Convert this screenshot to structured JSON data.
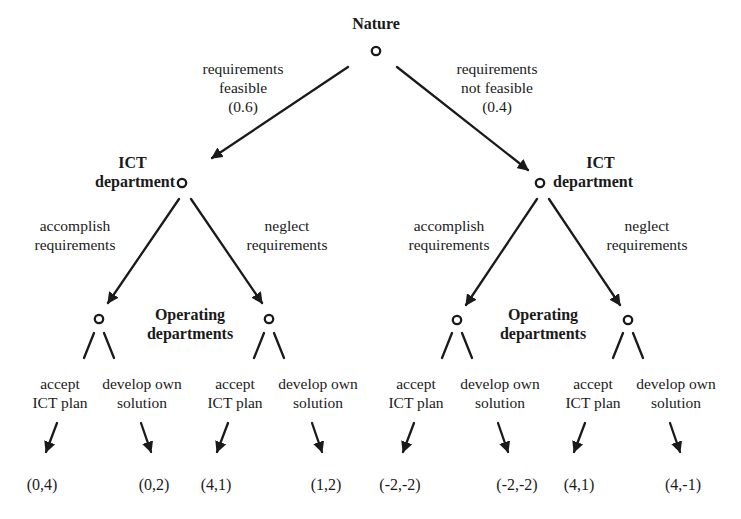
{
  "diagram": {
    "type": "game-tree",
    "root": {
      "player": "Nature",
      "branches": [
        {
          "label_line1": "requirements",
          "label_line2": "feasible",
          "probability": "(0.6)",
          "node": {
            "player_line1": "ICT",
            "player_line2": "department",
            "branches": [
              {
                "label_line1": "accomplish",
                "label_line2": "requirements",
                "node": {
                  "player_line1": "Operating",
                  "player_line2": "departments",
                  "branches": [
                    {
                      "label_line1": "accept",
                      "label_line2": "ICT plan",
                      "payoff": "(0,4)"
                    },
                    {
                      "label_line1": "develop own",
                      "label_line2": "solution",
                      "payoff": "(0,2)"
                    }
                  ]
                }
              },
              {
                "label_line1": "neglect",
                "label_line2": "requirements",
                "node": {
                  "branches": [
                    {
                      "label_line1": "accept",
                      "label_line2": "ICT plan",
                      "payoff": "(4,1)"
                    },
                    {
                      "label_line1": "develop own",
                      "label_line2": "solution",
                      "payoff": "(1,2)"
                    }
                  ]
                }
              }
            ]
          }
        },
        {
          "label_line1": "requirements",
          "label_line2": "not feasible",
          "probability": "(0.4)",
          "node": {
            "player_line1": "ICT",
            "player_line2": "department",
            "branches": [
              {
                "label_line1": "accomplish",
                "label_line2": "requirements",
                "node": {
                  "player_line1": "Operating",
                  "player_line2": "departments",
                  "branches": [
                    {
                      "label_line1": "accept",
                      "label_line2": "ICT plan",
                      "payoff": "(-2,-2)"
                    },
                    {
                      "label_line1": "develop own",
                      "label_line2": "solution",
                      "payoff": "(-2,-2)"
                    }
                  ]
                }
              },
              {
                "label_line1": "neglect",
                "label_line2": "requirements",
                "node": {
                  "branches": [
                    {
                      "label_line1": "accept",
                      "label_line2": "ICT plan",
                      "payoff": "(4,1)"
                    },
                    {
                      "label_line1": "develop own",
                      "label_line2": "solution",
                      "payoff": "(4,-1)"
                    }
                  ]
                }
              }
            ]
          }
        }
      ]
    }
  },
  "colors": {
    "ink": "#1a1a1a",
    "background": "#ffffff"
  }
}
